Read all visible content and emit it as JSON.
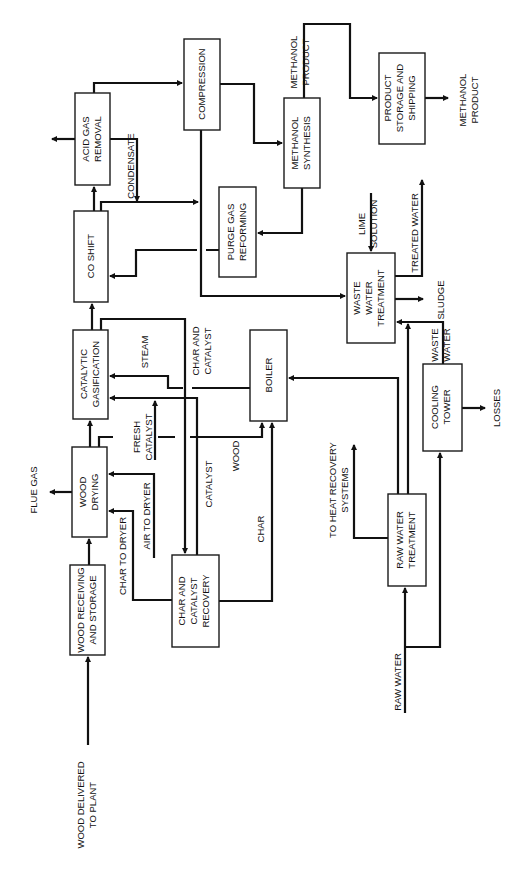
{
  "diagram": {
    "type": "process-flow",
    "orientation": "rotated-90-ccw",
    "colors": {
      "background": "#ffffff",
      "line": "#111111"
    },
    "units": [
      {
        "id": "wood_receiving",
        "label": [
          "WOOD RECEIVING",
          "AND STORAGE"
        ]
      },
      {
        "id": "wood_drying",
        "label": [
          "WOOD",
          "DRYING"
        ]
      },
      {
        "id": "catalytic_gasification",
        "label": [
          "CATALYTIC",
          "GASIFICATION"
        ]
      },
      {
        "id": "co_shift",
        "label": [
          "CO SHIFT"
        ]
      },
      {
        "id": "acid_gas_removal",
        "label": [
          "ACID GAS",
          "REMOVAL"
        ]
      },
      {
        "id": "compression",
        "label": [
          "COMPRESSION"
        ]
      },
      {
        "id": "methanol_synthesis",
        "label": [
          "METHANOL",
          "SYNTHESIS"
        ]
      },
      {
        "id": "product_storage",
        "label": [
          "PRODUCT",
          "STORAGE AND",
          "SHIPPING"
        ]
      },
      {
        "id": "purge_gas_reforming",
        "label": [
          "PURGE GAS",
          "REFORMING"
        ]
      },
      {
        "id": "waste_water_treatment",
        "label": [
          "WASTE",
          "WATER",
          "TREATMENT"
        ]
      },
      {
        "id": "boiler",
        "label": [
          "BOILER"
        ]
      },
      {
        "id": "cooling_tower",
        "label": [
          "COOLING",
          "TOWER"
        ]
      },
      {
        "id": "raw_water_treatment",
        "label": [
          "RAW WATER",
          "TREATMENT"
        ]
      },
      {
        "id": "char_catalyst_recovery",
        "label": [
          "CHAR AND",
          "CATALYST",
          "RECOVERY"
        ]
      }
    ],
    "stream_labels": {
      "wood_delivered": [
        "WOOD DELIVERED",
        "TO PLANT"
      ],
      "flue_gas": [
        "FLUE GAS"
      ],
      "char_to_dryer": [
        "CHAR TO DRYER"
      ],
      "air_to_dryer": [
        "AIR TO DRYER"
      ],
      "fresh_catalyst": [
        "FRESH",
        "CATALYST"
      ],
      "steam": [
        "STEAM"
      ],
      "char_and_catalyst": [
        "CHAR AND",
        "CATALYST"
      ],
      "catalyst": [
        "CATALYST"
      ],
      "wood": [
        "WOOD"
      ],
      "char": [
        "CHAR"
      ],
      "condensate": [
        "CONDENSATE"
      ],
      "methanol_product_top": [
        "METHANOL",
        "PRODUCT"
      ],
      "methanol_product_out": [
        "METHANOL",
        "PRODUCT"
      ],
      "lime_solution": [
        "LIME",
        "SOLUTION"
      ],
      "treated_water": [
        "TREATED WATER"
      ],
      "sludge": [
        "SLUDGE"
      ],
      "waste_water": [
        "WASTE",
        "WATER"
      ],
      "losses": [
        "LOSSES"
      ],
      "heat_recovery": [
        "TO HEAT RECOVERY",
        "SYSTEMS"
      ],
      "raw_water": [
        "RAW WATER"
      ]
    }
  }
}
